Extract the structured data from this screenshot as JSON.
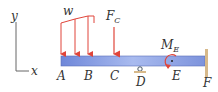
{
  "axes": {
    "y_label": "y",
    "x_label": "x"
  },
  "loads": {
    "distributed_label": "w",
    "force_label": "F",
    "force_sub": "C",
    "moment_label": "M",
    "moment_sub": "E"
  },
  "points": [
    "A",
    "B",
    "C",
    "D",
    "E",
    "F"
  ],
  "colors": {
    "load": "#e0453a",
    "beam_light": "#c6d3f3",
    "beam_dark": "#6f87d9",
    "wall": "#d7b98a",
    "text": "#333333"
  }
}
